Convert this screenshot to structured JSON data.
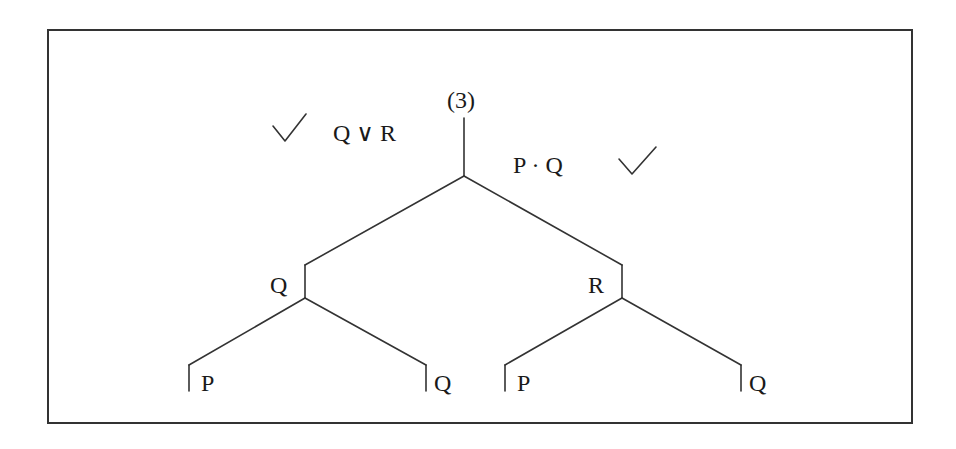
{
  "diagram": {
    "type": "truth-tree",
    "line_color": "#333333",
    "text_color": "#1a1a1a",
    "title": "(3)",
    "root": {
      "premises": [
        {
          "formula": "Q ∨ R",
          "checked": true,
          "check_side": "left",
          "check_glyph": "check-icon"
        },
        {
          "formula": "P · Q",
          "checked": true,
          "check_side": "right",
          "check_glyph": "check-icon"
        }
      ]
    },
    "branches": [
      {
        "node": "Q",
        "children": [
          {
            "node": "P"
          },
          {
            "node": "Q"
          }
        ]
      },
      {
        "node": "R",
        "children": [
          {
            "node": "P"
          },
          {
            "node": "Q"
          }
        ]
      }
    ]
  },
  "labels": {
    "title": "(3)",
    "premise_left": "Q ∨ R",
    "premise_right": "P · Q",
    "branch_left": "Q",
    "branch_right": "R",
    "leaf_ll": "P",
    "leaf_lr": "Q",
    "leaf_rl": "P",
    "leaf_rr": "Q"
  }
}
